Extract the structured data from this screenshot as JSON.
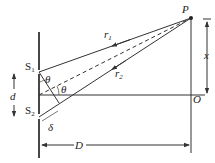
{
  "diagram": {
    "type": "double-slit interference geometry",
    "labels": {
      "point_p": "P",
      "point_o": "O",
      "slit_1": "S",
      "slit_1_sub": "1",
      "slit_2": "S",
      "slit_2_sub": "2",
      "ray_1": "r",
      "ray_1_sub": "1",
      "ray_2": "r",
      "ray_2_sub": "2",
      "angle_theta_upper": "θ",
      "angle_theta_center": "θ",
      "path_difference": "δ",
      "slit_separation": "d",
      "screen_distance": "D",
      "screen_offset": "x"
    },
    "colors": {
      "line": "#333333",
      "background": "#ffffff"
    }
  }
}
